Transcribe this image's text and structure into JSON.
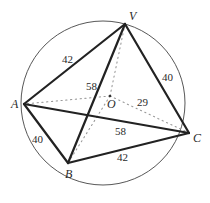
{
  "diagram": {
    "type": "pyramid-inscribed-in-circle",
    "circle": {
      "cx": 103,
      "cy": 103,
      "r": 82,
      "color": "#444444"
    },
    "points": {
      "V": {
        "x": 125,
        "y": 24,
        "label": "V",
        "lx": 129,
        "ly": 20
      },
      "A": {
        "x": 24,
        "y": 104,
        "label": "A",
        "lx": 11,
        "ly": 108
      },
      "B": {
        "x": 68,
        "y": 163,
        "label": "B",
        "lx": 65,
        "ly": 178
      },
      "C": {
        "x": 189,
        "y": 133,
        "label": "C",
        "lx": 193,
        "ly": 142
      },
      "O": {
        "x": 110,
        "y": 96,
        "label": "O",
        "lx": 107,
        "ly": 108
      }
    },
    "edges": [
      {
        "from": "V",
        "to": "A",
        "length": "42",
        "style": "solid"
      },
      {
        "from": "V",
        "to": "C",
        "length": "40",
        "style": "solid"
      },
      {
        "from": "V",
        "to": "B",
        "length": "58",
        "style": "solid"
      },
      {
        "from": "A",
        "to": "B",
        "length": "40",
        "style": "solid"
      },
      {
        "from": "A",
        "to": "C",
        "length": "58",
        "style": "solid"
      },
      {
        "from": "B",
        "to": "C",
        "length": "42",
        "style": "solid"
      },
      {
        "from": "O",
        "to": "V",
        "length": "",
        "style": "dotted"
      },
      {
        "from": "O",
        "to": "A",
        "length": "",
        "style": "dotted"
      },
      {
        "from": "O",
        "to": "B",
        "length": "",
        "style": "dotted"
      },
      {
        "from": "O",
        "to": "C",
        "length": "29",
        "style": "dotted"
      }
    ],
    "edge_labels": {
      "VA": {
        "text": "42",
        "x": 62,
        "y": 63
      },
      "VC": {
        "text": "40",
        "x": 162,
        "y": 81
      },
      "VB": {
        "text": "58",
        "x": 86,
        "y": 90
      },
      "AB": {
        "text": "40",
        "x": 32,
        "y": 143
      },
      "AC": {
        "text": "58",
        "x": 115,
        "y": 135
      },
      "BC": {
        "text": "42",
        "x": 117,
        "y": 161
      },
      "OC": {
        "text": "29",
        "x": 137,
        "y": 106
      }
    }
  }
}
